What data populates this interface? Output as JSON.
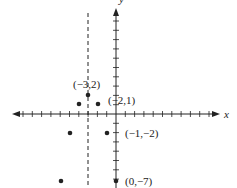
{
  "chart_data": {
    "type": "scatter",
    "title": "",
    "xlabel": "x",
    "ylabel": "y",
    "xlim": [
      -11,
      11
    ],
    "ylim": [
      -7,
      9
    ],
    "grid": false,
    "points": [
      {
        "x": -3,
        "y": 2,
        "label": "(−3,2)"
      },
      {
        "x": -2,
        "y": 1,
        "label": "(−2,1)"
      },
      {
        "x": -4,
        "y": 1,
        "label": ""
      },
      {
        "x": -1,
        "y": -2,
        "label": "(−1,−2)"
      },
      {
        "x": -5,
        "y": -2,
        "label": ""
      },
      {
        "x": 0,
        "y": -7,
        "label": "(0,−7)"
      },
      {
        "x": -6,
        "y": -7,
        "label": ""
      }
    ],
    "annotations": [
      {
        "type": "vertical-dashed-line",
        "x": -3,
        "description": "axis of symmetry x = -3"
      }
    ]
  },
  "labels": {
    "x_axis": "x",
    "y_axis": "y",
    "p1": "(−3,2)",
    "p2": "(−2,1)",
    "p3": "(−1,−2)",
    "p4": "(0,−7)"
  },
  "colors": {
    "ink": "#222222",
    "background": "#ffffff"
  }
}
